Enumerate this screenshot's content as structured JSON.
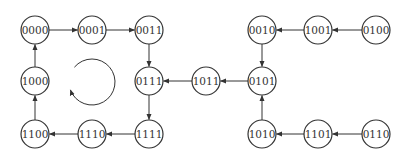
{
  "diagram": {
    "type": "state-transition-graph",
    "nodes": [
      {
        "id": "n0000",
        "label": "0000",
        "x": 35,
        "y": 30
      },
      {
        "id": "n0001",
        "label": "0001",
        "x": 92,
        "y": 30
      },
      {
        "id": "n0011",
        "label": "0011",
        "x": 149,
        "y": 30
      },
      {
        "id": "n1000",
        "label": "1000",
        "x": 35,
        "y": 81
      },
      {
        "id": "n0111",
        "label": "0111",
        "x": 149,
        "y": 81
      },
      {
        "id": "n1100",
        "label": "1100",
        "x": 35,
        "y": 134
      },
      {
        "id": "n1110",
        "label": "1110",
        "x": 92,
        "y": 134
      },
      {
        "id": "n1111",
        "label": "1111",
        "x": 149,
        "y": 134
      },
      {
        "id": "n1011",
        "label": "1011",
        "x": 206,
        "y": 81
      },
      {
        "id": "n0010",
        "label": "0010",
        "x": 262,
        "y": 30
      },
      {
        "id": "n1001",
        "label": "1001",
        "x": 318,
        "y": 30
      },
      {
        "id": "n0100",
        "label": "0100",
        "x": 376,
        "y": 30
      },
      {
        "id": "n0101",
        "label": "0101",
        "x": 262,
        "y": 81
      },
      {
        "id": "n1010",
        "label": "1010",
        "x": 262,
        "y": 134
      },
      {
        "id": "n1101",
        "label": "1101",
        "x": 318,
        "y": 134
      },
      {
        "id": "n0110",
        "label": "0110",
        "x": 376,
        "y": 134
      }
    ],
    "edges": [
      {
        "from": "0000",
        "to": "0001"
      },
      {
        "from": "0001",
        "to": "0011"
      },
      {
        "from": "0011",
        "to": "0111"
      },
      {
        "from": "0111",
        "to": "1111"
      },
      {
        "from": "1111",
        "to": "1110"
      },
      {
        "from": "1110",
        "to": "1100"
      },
      {
        "from": "1100",
        "to": "1000"
      },
      {
        "from": "1000",
        "to": "0000"
      },
      {
        "from": "1011",
        "to": "0111"
      },
      {
        "from": "0101",
        "to": "1011"
      },
      {
        "from": "0010",
        "to": "0101"
      },
      {
        "from": "1001",
        "to": "0010"
      },
      {
        "from": "0100",
        "to": "1001"
      },
      {
        "from": "1010",
        "to": "0101"
      },
      {
        "from": "1101",
        "to": "1010"
      },
      {
        "from": "0110",
        "to": "1101"
      }
    ],
    "cycle_indicator": {
      "direction": "counterclockwise",
      "center_x": 92,
      "center_y": 82,
      "radius": 23
    },
    "colors": {
      "stroke": "#333333",
      "background": "#ffffff"
    }
  }
}
